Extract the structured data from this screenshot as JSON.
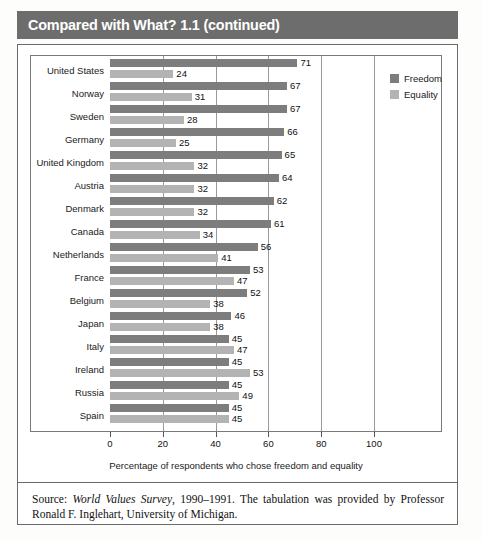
{
  "header": {
    "title": "Compared with What? 1.1 (continued)"
  },
  "legend": {
    "items": [
      {
        "label": "Freedom",
        "color": "#7d7d7d",
        "key": "freedom"
      },
      {
        "label": "Equality",
        "color": "#b3b3b3",
        "key": "equality"
      }
    ]
  },
  "source": {
    "prefix": "Source: ",
    "italic_title": "World Values Survey",
    "rest": ", 1990–1991. The tabulation was provided by Professor Ronald F. Inglehart, University of Michigan."
  },
  "chart_data": {
    "type": "bar",
    "orientation": "horizontal",
    "title": "Compared with What? 1.1 (continued)",
    "xlabel": "Percentage of respondents who chose freedom and equality",
    "ylabel": "",
    "xlim": [
      0,
      100
    ],
    "xticks": [
      0,
      20,
      40,
      60,
      80,
      100
    ],
    "grid": true,
    "grid_axis": "x",
    "legend_position": "right",
    "categories": [
      "United States",
      "Norway",
      "Sweden",
      "Germany",
      "United Kingdom",
      "Austria",
      "Denmark",
      "Canada",
      "Netherlands",
      "France",
      "Belgium",
      "Japan",
      "Italy",
      "Ireland",
      "Russia",
      "Spain"
    ],
    "series": [
      {
        "name": "Freedom",
        "color": "#7d7d7d",
        "values": [
          71,
          67,
          67,
          66,
          65,
          64,
          62,
          61,
          56,
          53,
          52,
          46,
          45,
          45,
          45,
          45
        ]
      },
      {
        "name": "Equality",
        "color": "#b3b3b3",
        "values": [
          24,
          31,
          28,
          25,
          32,
          32,
          32,
          34,
          41,
          47,
          38,
          38,
          47,
          53,
          49,
          45
        ]
      }
    ]
  }
}
